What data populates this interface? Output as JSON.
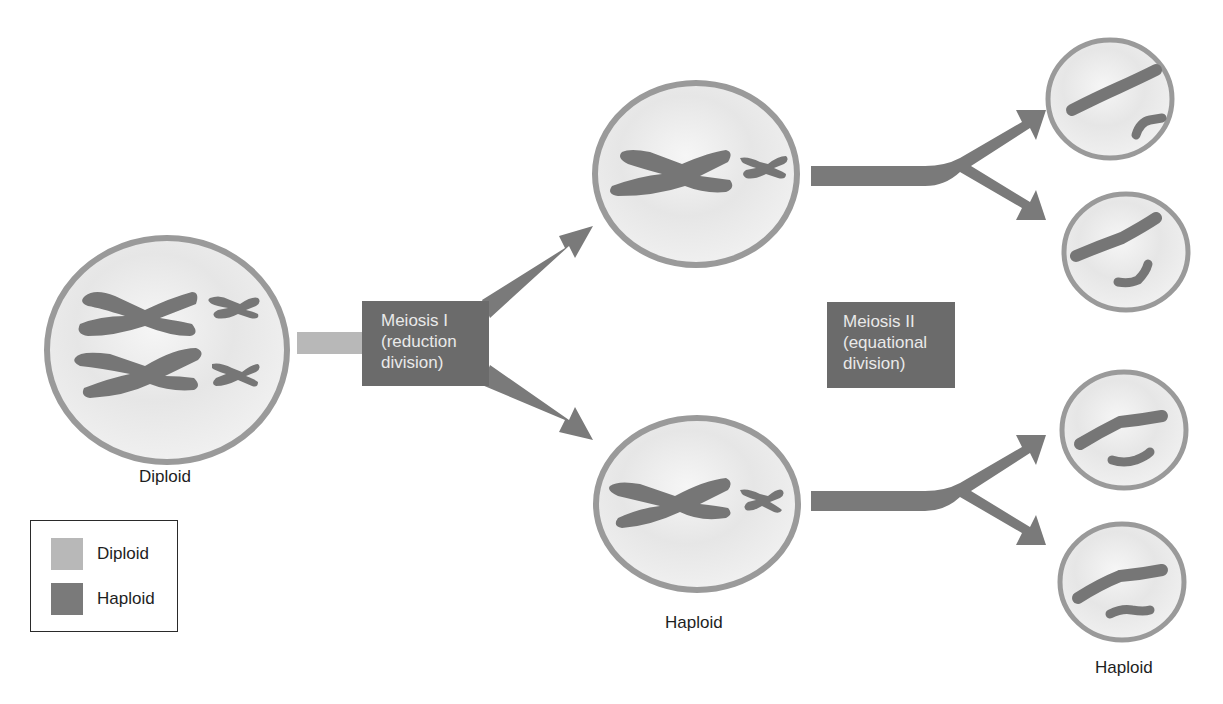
{
  "diagram": {
    "colors": {
      "diploid": "#b8b8b8",
      "haploid": "#7a7a7a",
      "cell_fill": "#ececec",
      "cell_border": "#9a9a9a",
      "chromosome": "#767676",
      "box": "#6b6b6b",
      "box_text": "#e9e9e9"
    },
    "stages": [
      {
        "id": "meiosis-1",
        "lines": [
          "Meiosis I",
          "(reduction",
          "division)"
        ]
      },
      {
        "id": "meiosis-2",
        "lines": [
          "Meiosis II",
          "(equational",
          "division)"
        ]
      }
    ],
    "cell_labels": {
      "parent": "Diploid",
      "meiosis1_products": "Haploid",
      "meiosis2_products": "Haploid"
    },
    "legend": {
      "items": [
        {
          "label": "Diploid",
          "color": "#b8b8b8"
        },
        {
          "label": "Haploid",
          "color": "#7a7a7a"
        }
      ]
    },
    "cells": [
      {
        "name": "parent-diploid-cell",
        "chromosomes": "2 pairs of replicated chromosomes (X-shaped)"
      },
      {
        "name": "meiosis1-top-cell",
        "chromosomes": "1 large + 1 small replicated chromosome"
      },
      {
        "name": "meiosis1-bottom-cell",
        "chromosomes": "1 large + 1 small replicated chromosome"
      },
      {
        "name": "gamete-1",
        "chromosomes": "1 large + 1 small single chromatid"
      },
      {
        "name": "gamete-2",
        "chromosomes": "1 large + 1 small single chromatid"
      },
      {
        "name": "gamete-3",
        "chromosomes": "1 large + 1 small single chromatid"
      },
      {
        "name": "gamete-4",
        "chromosomes": "1 large + 1 small single chromatid"
      }
    ]
  }
}
